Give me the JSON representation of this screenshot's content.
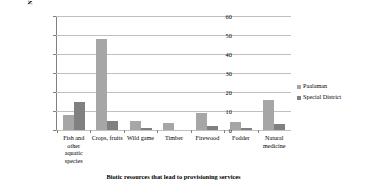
{
  "chart_data": {
    "type": "bar",
    "title": "",
    "xlabel": "Biotic resources that lead to provisioning services",
    "ylabel": "Number of plants and animals mentioned by the locals",
    "ylim": [
      0,
      60
    ],
    "yticks": [
      0,
      10,
      20,
      30,
      40,
      50,
      60
    ],
    "grid": true,
    "legend_position": "right",
    "categories": [
      "Fish and other aquatic species",
      "Crops, fruits",
      "Wild game",
      "Timber",
      "Firewood",
      "Fodder",
      "Natural medicine"
    ],
    "series": [
      {
        "name": "Paalaman",
        "color": "#a6a6a6",
        "values": [
          8,
          48,
          5,
          3.5,
          9,
          4,
          16
        ]
      },
      {
        "name": "Special District",
        "color": "#808080",
        "values": [
          15,
          5,
          1,
          0,
          2,
          1,
          3
        ]
      }
    ]
  },
  "legend": {
    "items": [
      {
        "label": "Paalaman"
      },
      {
        "label": "Special District"
      }
    ]
  }
}
